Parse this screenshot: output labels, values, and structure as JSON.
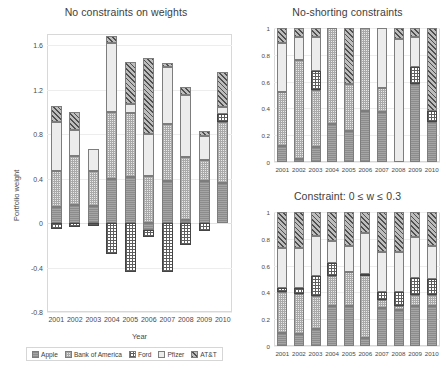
{
  "figure": {
    "series_names": [
      "Apple",
      "Bank of America",
      "Ford",
      "Pfizer",
      "AT&T"
    ],
    "years": [
      "2001",
      "2002",
      "2003",
      "2004",
      "2005",
      "2006",
      "2007",
      "2008",
      "2009",
      "2010"
    ]
  },
  "legend": {
    "items": [
      {
        "label": "Apple",
        "key": "apple"
      },
      {
        "label": "Bank of America",
        "key": "boa"
      },
      {
        "label": "Ford",
        "key": "ford"
      },
      {
        "label": "Pfizer",
        "key": "pfizer"
      },
      {
        "label": "AT&T",
        "key": "att"
      }
    ]
  },
  "chart_data": [
    {
      "id": "unconstrained",
      "type": "bar",
      "stacked": true,
      "title": "No constraints on weights",
      "xlabel": "Year",
      "ylabel": "Portfolio weight",
      "categories": [
        "2001",
        "2002",
        "2003",
        "2004",
        "2005",
        "2006",
        "2007",
        "2008",
        "2009",
        "2010"
      ],
      "ylim": [
        -0.8,
        1.7
      ],
      "yticks": [
        -0.8,
        -0.4,
        0,
        0.4,
        0.8,
        1.2,
        1.6
      ],
      "ytick_labels": [
        "-0.8",
        "-0.4",
        "0",
        "0.4",
        "0.8",
        "1.2",
        "1.6"
      ],
      "grid": true,
      "legend_position": "bottom",
      "series": [
        {
          "name": "Apple",
          "values": [
            0.14,
            0.16,
            0.15,
            0.4,
            0.41,
            -0.06,
            0.38,
            0.03,
            0.38,
            0.36
          ]
        },
        {
          "name": "Bank of America",
          "values": [
            0.33,
            0.44,
            0.32,
            0.6,
            0.58,
            0.42,
            0.51,
            0.56,
            0.19,
            0.55
          ]
        },
        {
          "name": "Ford",
          "values": [
            -0.05,
            -0.04,
            -0.03,
            -0.28,
            -0.44,
            -0.07,
            -0.44,
            -0.2,
            -0.07,
            0.07
          ]
        },
        {
          "name": "Pfizer",
          "values": [
            0.44,
            0.24,
            0.2,
            0.62,
            0.08,
            0.38,
            0.51,
            0.56,
            0.21,
            0.06
          ]
        },
        {
          "name": "AT&T",
          "values": [
            0.14,
            0.16,
            0.0,
            0.06,
            0.38,
            0.68,
            0.04,
            0.07,
            0.05,
            0.32
          ]
        }
      ]
    },
    {
      "id": "no-shorting",
      "type": "bar",
      "stacked": true,
      "title": "No-shorting constraints",
      "xlabel": "",
      "ylabel": "",
      "categories": [
        "2001",
        "2002",
        "2003",
        "2004",
        "2005",
        "2006",
        "2007",
        "2008",
        "2009",
        "2010"
      ],
      "ylim": [
        0,
        1
      ],
      "yticks": [
        0,
        0.2,
        0.4,
        0.6,
        0.8,
        1
      ],
      "ytick_labels": [
        "0",
        "0.2",
        "0.4",
        "0.6",
        "0.8",
        "1"
      ],
      "grid": true,
      "legend_position": "none",
      "series": [
        {
          "name": "Apple",
          "values": [
            0.12,
            0.02,
            0.11,
            0.28,
            0.23,
            0.38,
            0.37,
            0.0,
            0.58,
            0.3
          ]
        },
        {
          "name": "Bank of America",
          "values": [
            0.4,
            0.74,
            0.43,
            0.72,
            0.35,
            0.62,
            0.18,
            0.0,
            0.0,
            0.0
          ]
        },
        {
          "name": "Ford",
          "values": [
            0.0,
            0.0,
            0.14,
            0.0,
            0.0,
            0.0,
            0.0,
            0.0,
            0.13,
            0.08
          ]
        },
        {
          "name": "Pfizer",
          "values": [
            0.37,
            0.17,
            0.25,
            0.0,
            0.0,
            0.0,
            0.45,
            0.92,
            0.22,
            0.0
          ]
        },
        {
          "name": "AT&T",
          "values": [
            0.11,
            0.07,
            0.07,
            0.0,
            0.42,
            0.0,
            0.0,
            0.08,
            0.07,
            0.62
          ]
        }
      ]
    },
    {
      "id": "box-constrained",
      "type": "bar",
      "stacked": true,
      "title": "Constraint: 0 ≤ w ≤ 0.3",
      "xlabel": "",
      "ylabel": "",
      "categories": [
        "2001",
        "2002",
        "2003",
        "2004",
        "2005",
        "2006",
        "2007",
        "2008",
        "2009",
        "2010"
      ],
      "ylim": [
        0,
        1
      ],
      "yticks": [
        0,
        0.2,
        0.4,
        0.6,
        0.8,
        1
      ],
      "ytick_labels": [
        "0",
        "0.2",
        "0.4",
        "0.6",
        "0.8",
        "1"
      ],
      "grid": true,
      "legend_position": "none",
      "series": [
        {
          "name": "Apple",
          "values": [
            0.1,
            0.09,
            0.13,
            0.3,
            0.3,
            0.06,
            0.28,
            0.27,
            0.3,
            0.3
          ]
        },
        {
          "name": "Bank of America",
          "values": [
            0.3,
            0.3,
            0.24,
            0.22,
            0.25,
            0.47,
            0.06,
            0.03,
            0.08,
            0.08
          ]
        },
        {
          "name": "Ford",
          "values": [
            0.03,
            0.04,
            0.15,
            0.1,
            0.0,
            0.01,
            0.06,
            0.1,
            0.13,
            0.12
          ]
        },
        {
          "name": "Pfizer",
          "values": [
            0.3,
            0.3,
            0.3,
            0.16,
            0.2,
            0.3,
            0.3,
            0.3,
            0.3,
            0.25
          ]
        },
        {
          "name": "AT&T",
          "values": [
            0.27,
            0.27,
            0.18,
            0.22,
            0.25,
            0.16,
            0.3,
            0.3,
            0.19,
            0.25
          ]
        }
      ]
    }
  ]
}
